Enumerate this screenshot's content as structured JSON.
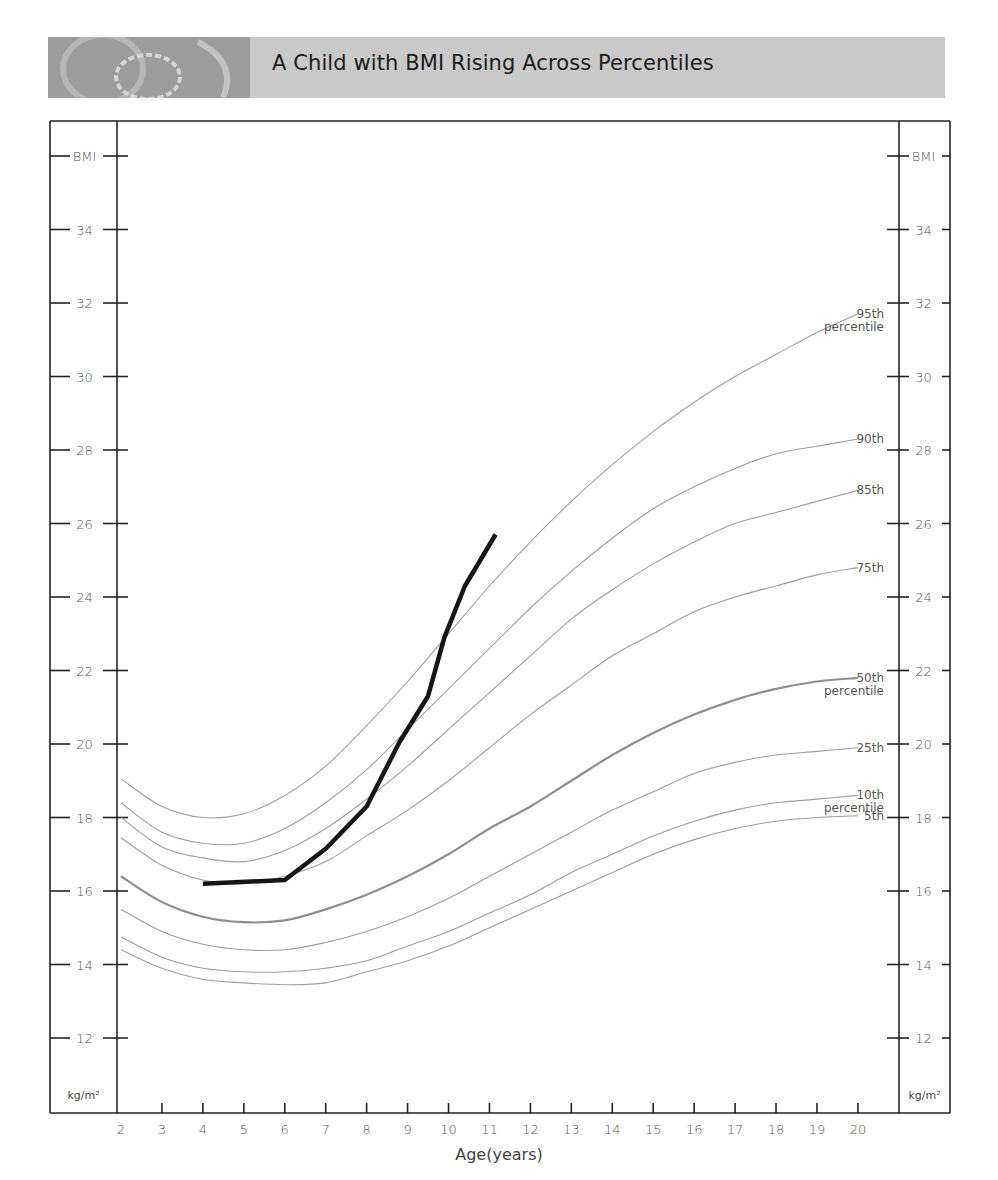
{
  "header": {
    "title": "A Child with BMI Rising Across Percentiles",
    "band_color": "#c9c9c9",
    "image_color": "#9c9c9c"
  },
  "chart_data": {
    "type": "line",
    "title": "A Child with BMI Rising Across Percentiles",
    "xlabel": "Age(years)",
    "ylabel": "BMI",
    "y_unit": "kg/m²",
    "xlim": [
      2,
      20
    ],
    "ylim": [
      12,
      36
    ],
    "x_ticks": [
      2,
      3,
      4,
      5,
      6,
      7,
      8,
      9,
      10,
      11,
      12,
      13,
      14,
      15,
      16,
      17,
      18,
      19,
      20
    ],
    "y_ticks": [
      12,
      14,
      16,
      18,
      20,
      22,
      24,
      26,
      28,
      30,
      32,
      34
    ],
    "y_axis_top_label": "BMI",
    "grid": false,
    "x": [
      2,
      3,
      4,
      5,
      6,
      7,
      8,
      9,
      10,
      11,
      12,
      13,
      14,
      15,
      16,
      17,
      18,
      19,
      20
    ],
    "series": [
      {
        "name": "95th percentile",
        "label_lines": [
          "95th",
          "percentile"
        ],
        "style": "percentile",
        "values": [
          19.05,
          18.3,
          18.0,
          18.1,
          18.6,
          19.4,
          20.5,
          21.7,
          23.0,
          24.3,
          25.5,
          26.6,
          27.6,
          28.5,
          29.3,
          30.0,
          30.6,
          31.2,
          31.7
        ]
      },
      {
        "name": "90th",
        "label_lines": [
          "90th"
        ],
        "style": "percentile",
        "values": [
          18.4,
          17.6,
          17.3,
          17.3,
          17.7,
          18.4,
          19.3,
          20.4,
          21.5,
          22.6,
          23.7,
          24.7,
          25.6,
          26.4,
          27.0,
          27.5,
          27.9,
          28.1,
          28.3
        ]
      },
      {
        "name": "85th",
        "label_lines": [
          "85th"
        ],
        "style": "percentile",
        "values": [
          18.0,
          17.2,
          16.9,
          16.8,
          17.1,
          17.7,
          18.5,
          19.4,
          20.4,
          21.4,
          22.4,
          23.4,
          24.2,
          24.9,
          25.5,
          26.0,
          26.3,
          26.6,
          26.9
        ]
      },
      {
        "name": "75th",
        "label_lines": [
          "75th"
        ],
        "style": "percentile",
        "values": [
          17.45,
          16.7,
          16.3,
          16.2,
          16.4,
          16.8,
          17.5,
          18.2,
          19.0,
          19.9,
          20.8,
          21.6,
          22.4,
          23.0,
          23.6,
          24.0,
          24.3,
          24.6,
          24.8
        ]
      },
      {
        "name": "50th percentile",
        "label_lines": [
          "50th",
          "percentile"
        ],
        "style": "median",
        "values": [
          16.4,
          15.7,
          15.3,
          15.15,
          15.2,
          15.5,
          15.9,
          16.4,
          17.0,
          17.7,
          18.3,
          19.0,
          19.7,
          20.3,
          20.8,
          21.2,
          21.5,
          21.7,
          21.8
        ]
      },
      {
        "name": "25th",
        "label_lines": [
          "25th"
        ],
        "style": "percentile",
        "values": [
          15.5,
          14.9,
          14.55,
          14.4,
          14.4,
          14.6,
          14.9,
          15.3,
          15.8,
          16.4,
          17.0,
          17.6,
          18.2,
          18.7,
          19.2,
          19.5,
          19.7,
          19.8,
          19.9
        ]
      },
      {
        "name": "10th percentile",
        "label_lines": [
          "10th",
          "percentile"
        ],
        "style": "percentile",
        "values": [
          14.75,
          14.2,
          13.9,
          13.8,
          13.8,
          13.9,
          14.1,
          14.5,
          14.9,
          15.4,
          15.9,
          16.5,
          17.0,
          17.5,
          17.9,
          18.2,
          18.4,
          18.5,
          18.6
        ]
      },
      {
        "name": "5th",
        "label_lines": [
          "5th"
        ],
        "style": "percentile",
        "values": [
          14.4,
          13.9,
          13.6,
          13.5,
          13.45,
          13.5,
          13.8,
          14.1,
          14.5,
          15.0,
          15.5,
          16.0,
          16.5,
          17.0,
          17.4,
          17.7,
          17.9,
          18.0,
          18.05
        ]
      }
    ],
    "child": {
      "name": "Child BMI",
      "points": [
        [
          4.0,
          16.2
        ],
        [
          6.0,
          16.3
        ],
        [
          7.0,
          17.15
        ],
        [
          8.0,
          18.3
        ],
        [
          8.8,
          20.05
        ],
        [
          9.5,
          21.3
        ],
        [
          9.9,
          22.9
        ],
        [
          10.4,
          24.3
        ],
        [
          11.15,
          25.7
        ]
      ]
    }
  }
}
